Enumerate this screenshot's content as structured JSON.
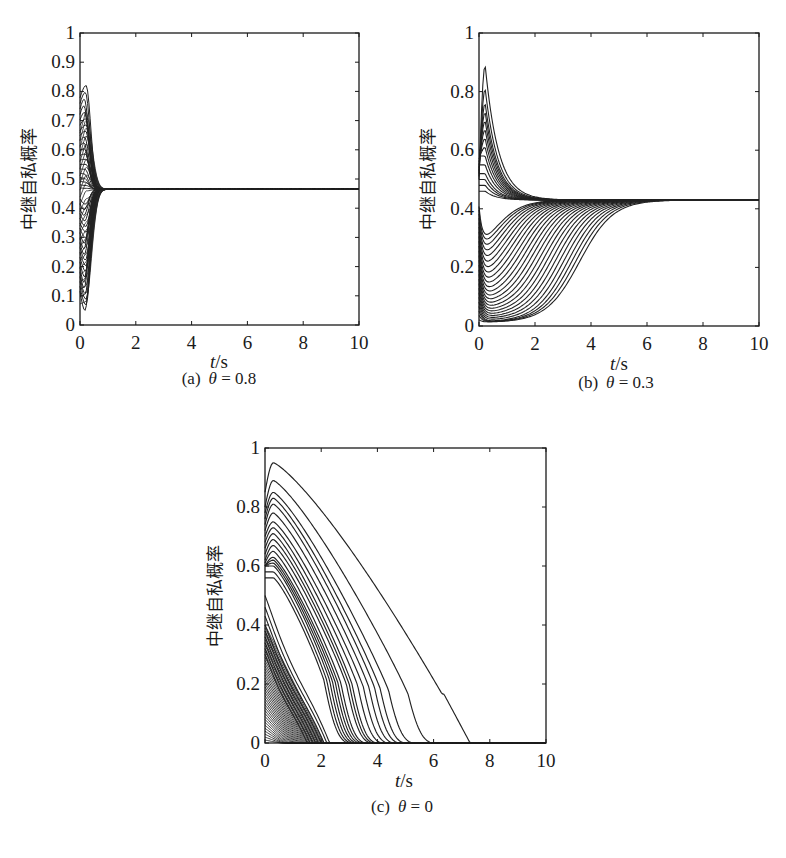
{
  "figure": {
    "ylabel": "中继自私概率",
    "xlabel_italic": "t",
    "xlabel_unit": "/s",
    "line_color": "#222222",
    "frame_color": "#1a1a1a"
  },
  "chart_data": [
    {
      "type": "line",
      "id": "a",
      "caption_prefix": "(a)",
      "caption_param": "θ",
      "caption_value": "0.8",
      "caption": "(a) θ = 0.8",
      "xlabel": "t/s",
      "ylabel": "中继自私概率",
      "xlim": [
        0,
        10
      ],
      "ylim": [
        0,
        1
      ],
      "xticks": [
        0,
        2,
        4,
        6,
        8,
        10
      ],
      "yticks": [
        0,
        0.1,
        0.2,
        0.3,
        0.4,
        0.5,
        0.6,
        0.7,
        0.8,
        0.9,
        1
      ],
      "ytick_labels": [
        "0",
        "0.1",
        "0.2",
        "0.3",
        "0.4",
        "0.5",
        "0.6",
        "0.7",
        "0.8",
        "0.9",
        "1"
      ],
      "grid": false,
      "steady_state": 0.465,
      "convergence_time": 1.5,
      "description": "Many trajectories from initial values in [0,1]; upper curves overshoot to peak ~0.82 near t=0.2, lower curves dip to ~0.05 near t=0.2, all converge to ~0.465 by t≈1.5 s",
      "series_summary": {
        "count": 40,
        "max_peak": 0.82,
        "min_trough": 0.05,
        "peak_time": 0.2
      }
    },
    {
      "type": "line",
      "id": "b",
      "caption_prefix": "(b)",
      "caption_param": "θ",
      "caption_value": "0.3",
      "caption": "(b) θ = 0.3",
      "xlabel": "t/s",
      "ylabel": "中继自私概率",
      "xlim": [
        0,
        10
      ],
      "ylim": [
        0,
        1
      ],
      "xticks": [
        0,
        2,
        4,
        6,
        8,
        10
      ],
      "yticks": [
        0,
        0.2,
        0.4,
        0.6,
        0.8,
        1
      ],
      "ytick_labels": [
        "0",
        "0.2",
        "0.4",
        "0.6",
        "0.8",
        "1"
      ],
      "grid": false,
      "steady_state": 0.43,
      "convergence_time": 5.5,
      "description": "Upper trajectories peak up to ~0.89 near t=0.2 then decay to ~0.43 by t≈2; lower trajectories dip near 0.01-0.4 then rise sigmoidally, the slowest reaching ~0.43 at t≈5.5 s",
      "series_summary": {
        "count": 40,
        "max_peak": 0.89,
        "min_trough": 0.01,
        "peak_time": 0.2,
        "slowest_rise_midpoint": 3.6
      }
    },
    {
      "type": "line",
      "id": "c",
      "caption_prefix": "(c)",
      "caption_param": "θ",
      "caption_value": "0",
      "caption": "(c) θ = 0",
      "xlabel": "t/s",
      "ylabel": "中继自私概率",
      "xlim": [
        0,
        10
      ],
      "ylim": [
        0,
        1
      ],
      "xticks": [
        0,
        2,
        4,
        6,
        8,
        10
      ],
      "yticks": [
        0,
        0.2,
        0.4,
        0.6,
        0.8,
        1
      ],
      "ytick_labels": [
        "0",
        "0.2",
        "0.4",
        "0.6",
        "0.8",
        "1"
      ],
      "grid": false,
      "steady_state": 0,
      "convergence_time": 7.5,
      "description": "All trajectories decay to 0; highest curve peaks ~0.95 at t≈0.3, shows a plateau ~0.2 around t≈5.5-6.2 and reaches 0 at t≈7.3 s; dense bundle of low-initial curves reaches 0 before t≈2",
      "series_summary": {
        "count": 40,
        "max_peak": 0.95,
        "peak_time": 0.3,
        "latest_extinction": 7.3,
        "plateau_value": 0.2
      }
    }
  ]
}
